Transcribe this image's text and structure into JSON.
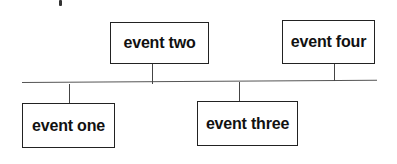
{
  "diagram": {
    "type": "timeline",
    "events": [
      {
        "label": "event one",
        "position": "below",
        "order": 1
      },
      {
        "label": "event two",
        "position": "above",
        "order": 2
      },
      {
        "label": "event three",
        "position": "below",
        "order": 3
      },
      {
        "label": "event four",
        "position": "above",
        "order": 4
      }
    ]
  }
}
